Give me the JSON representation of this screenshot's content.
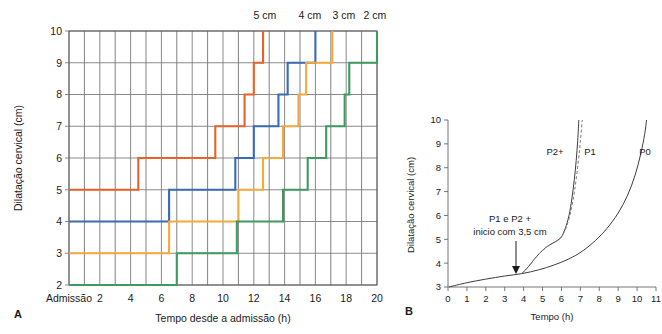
{
  "figure": {
    "panel_a_letter": "A",
    "panel_b_letter": "B"
  },
  "panelA": {
    "y_axis_title": "Dilatação cervical (cm)",
    "x_axis_title": "Tempo desde a admissão (h)",
    "y_ticks": [
      "10",
      "9",
      "8",
      "7",
      "6",
      "5",
      "4",
      "3",
      "2"
    ],
    "x_ticks": [
      "Admissão",
      "2",
      "4",
      "6",
      "8",
      "10",
      "12",
      "14",
      "16",
      "18",
      "20"
    ],
    "top_labels": [
      {
        "text": "5 cm",
        "color": "#e8622a"
      },
      {
        "text": "4 cm",
        "color": "#3a6bb5"
      },
      {
        "text": "3 cm",
        "color": "#f5a93c"
      },
      {
        "text": "2 cm",
        "color": "#3e9b5f"
      }
    ]
  },
  "panelB": {
    "y_axis_title": "Dilatação cervical (cm)",
    "x_axis_title": "Tempo (h)",
    "y_ticks": [
      "10",
      "9",
      "8",
      "7",
      "6",
      "5",
      "4",
      "3"
    ],
    "x_ticks": [
      "0",
      "1",
      "2",
      "3",
      "4",
      "5",
      "6",
      "7",
      "8",
      "9",
      "10",
      "11"
    ],
    "curve_labels": [
      {
        "text": "P2+"
      },
      {
        "text": "P1"
      },
      {
        "text": "P0"
      }
    ],
    "annotation_line1": "P1 e P2 +",
    "annotation_line2": "inicio com 3,5 cm"
  },
  "chart_data": [
    {
      "type": "line",
      "id": "panel-a",
      "title": "",
      "xlabel": "Tempo desde a admissão (h)",
      "ylabel": "Dilatação cervical (cm)",
      "xlim": [
        0,
        20
      ],
      "ylim": [
        2,
        10
      ],
      "grid": true,
      "interpolation": "step-after",
      "x_tick_values": [
        0,
        2,
        4,
        6,
        8,
        10,
        12,
        14,
        16,
        18,
        20
      ],
      "x_tick_labels": [
        "Admissão",
        "2",
        "4",
        "6",
        "8",
        "10",
        "12",
        "14",
        "16",
        "18",
        "20"
      ],
      "y_tick_values": [
        2,
        3,
        4,
        5,
        6,
        7,
        8,
        9,
        10
      ],
      "legend_position": "top",
      "series": [
        {
          "name": "5 cm",
          "color": "#e8622a",
          "points": [
            [
              0,
              5
            ],
            [
              4.5,
              5
            ],
            [
              4.5,
              6
            ],
            [
              9.5,
              6
            ],
            [
              9.5,
              7
            ],
            [
              11.4,
              7
            ],
            [
              11.4,
              8
            ],
            [
              12.0,
              8
            ],
            [
              12.0,
              9
            ],
            [
              12.6,
              9
            ],
            [
              12.6,
              10
            ]
          ]
        },
        {
          "name": "4 cm",
          "color": "#3a6bb5",
          "points": [
            [
              0,
              4
            ],
            [
              6.5,
              4
            ],
            [
              6.5,
              5
            ],
            [
              10.8,
              5
            ],
            [
              10.8,
              6
            ],
            [
              12.0,
              6
            ],
            [
              12.0,
              7
            ],
            [
              13.6,
              7
            ],
            [
              13.6,
              8
            ],
            [
              14.2,
              8
            ],
            [
              14.2,
              9
            ],
            [
              16.0,
              9
            ],
            [
              16.0,
              10
            ]
          ]
        },
        {
          "name": "3 cm",
          "color": "#f5a93c",
          "points": [
            [
              0,
              3
            ],
            [
              6.5,
              3
            ],
            [
              6.5,
              4
            ],
            [
              11.0,
              4
            ],
            [
              11.0,
              5
            ],
            [
              12.6,
              5
            ],
            [
              12.6,
              6
            ],
            [
              13.9,
              6
            ],
            [
              13.9,
              7
            ],
            [
              14.9,
              7
            ],
            [
              14.9,
              8
            ],
            [
              15.4,
              8
            ],
            [
              15.4,
              9
            ],
            [
              17.1,
              9
            ],
            [
              17.1,
              10
            ]
          ]
        },
        {
          "name": "2 cm",
          "color": "#3e9b5f",
          "points": [
            [
              0,
              2
            ],
            [
              7.0,
              2
            ],
            [
              7.0,
              3
            ],
            [
              10.9,
              3
            ],
            [
              10.9,
              4
            ],
            [
              13.9,
              4
            ],
            [
              13.9,
              5
            ],
            [
              15.5,
              5
            ],
            [
              15.5,
              6
            ],
            [
              16.7,
              6
            ],
            [
              16.7,
              7
            ],
            [
              17.9,
              7
            ],
            [
              17.9,
              8
            ],
            [
              18.2,
              8
            ],
            [
              18.2,
              9
            ],
            [
              20.0,
              9
            ],
            [
              20.0,
              10
            ]
          ]
        }
      ]
    },
    {
      "type": "line",
      "id": "panel-b",
      "title": "",
      "xlabel": "Tempo (h)",
      "ylabel": "Dilatação cervical (cm)",
      "xlim": [
        0,
        11
      ],
      "ylim": [
        3,
        10
      ],
      "grid": false,
      "x_tick_values": [
        0,
        1,
        2,
        3,
        4,
        5,
        6,
        7,
        8,
        9,
        10,
        11
      ],
      "y_tick_values": [
        3,
        4,
        5,
        6,
        7,
        8,
        9,
        10
      ],
      "annotations": [
        {
          "text": "P1 e P2 + / inicio com 3,5 cm",
          "points_to_x": 3.9,
          "points_to_y": 3.55
        }
      ],
      "series": [
        {
          "name": "P0",
          "style": "solid",
          "color": "#3d3d3d",
          "points": [
            [
              0.05,
              3.0
            ],
            [
              1.0,
              3.18
            ],
            [
              2.0,
              3.33
            ],
            [
              3.0,
              3.46
            ],
            [
              3.9,
              3.56
            ],
            [
              4.8,
              3.72
            ],
            [
              5.6,
              3.92
            ],
            [
              6.4,
              4.18
            ],
            [
              7.1,
              4.5
            ],
            [
              7.8,
              4.95
            ],
            [
              8.4,
              5.45
            ],
            [
              9.0,
              6.1
            ],
            [
              9.5,
              6.85
            ],
            [
              9.9,
              7.7
            ],
            [
              10.2,
              8.6
            ],
            [
              10.4,
              9.4
            ],
            [
              10.5,
              10.0
            ]
          ]
        },
        {
          "name": "P2+",
          "style": "solid",
          "color": "#3d3d3d",
          "points": [
            [
              3.9,
              3.56
            ],
            [
              4.25,
              3.85
            ],
            [
              4.55,
              4.15
            ],
            [
              4.85,
              4.42
            ],
            [
              5.15,
              4.64
            ],
            [
              5.45,
              4.8
            ],
            [
              5.75,
              4.93
            ],
            [
              6.0,
              5.1
            ],
            [
              6.2,
              5.45
            ],
            [
              6.4,
              6.0
            ],
            [
              6.55,
              6.7
            ],
            [
              6.68,
              7.5
            ],
            [
              6.78,
              8.3
            ],
            [
              6.86,
              9.15
            ],
            [
              6.92,
              10.0
            ]
          ]
        },
        {
          "name": "P1",
          "style": "dashed",
          "color": "#7a7a7a",
          "points": [
            [
              3.9,
              3.56
            ],
            [
              4.3,
              3.9
            ],
            [
              4.6,
              4.2
            ],
            [
              4.9,
              4.45
            ],
            [
              5.2,
              4.66
            ],
            [
              5.5,
              4.82
            ],
            [
              5.8,
              4.96
            ],
            [
              6.05,
              5.18
            ],
            [
              6.3,
              5.6
            ],
            [
              6.5,
              6.2
            ],
            [
              6.68,
              6.95
            ],
            [
              6.82,
              7.8
            ],
            [
              6.95,
              8.7
            ],
            [
              7.03,
              9.4
            ],
            [
              7.1,
              10.0
            ]
          ]
        }
      ]
    }
  ]
}
